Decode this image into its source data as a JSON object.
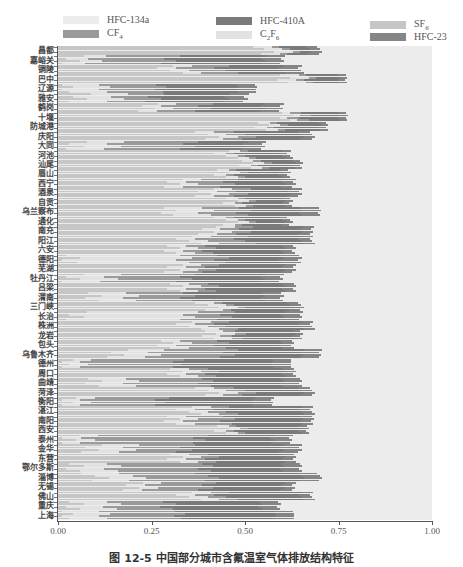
{
  "chart_data": {
    "type": "bar",
    "orientation": "horizontal",
    "stacked": "percent",
    "title": "",
    "caption": "图 12-5   中国部分城市含氟温室气体排放结构特征",
    "xlabel": "",
    "ylabel": "",
    "xlim": [
      0,
      1
    ],
    "xticks": [
      "0.00",
      "0.25",
      "0.50",
      "0.75",
      "1.00"
    ],
    "grid": false,
    "legend_position": "top",
    "legend": [
      {
        "name": "HFC-134a",
        "color": "#ececec"
      },
      {
        "name": "CF4",
        "color": "#9a9a9a"
      },
      {
        "name": "HFC-410A",
        "color": "#7a7a7a"
      },
      {
        "name": "C2F6",
        "color": "#e2e2e2"
      },
      {
        "name": "SF6",
        "color": "#c6c6c6"
      },
      {
        "name": "HFC-23",
        "color": "#858585"
      }
    ],
    "series_order": [
      "SF6",
      "C2F6",
      "CF4",
      "HFC-410A",
      "HFC-23",
      "HFC-134a"
    ],
    "categories": [
      "昌都",
      "嘉峪关",
      "铜陵",
      "巴中",
      "辽源",
      "雅安",
      "鹤岗",
      "十堰",
      "防城港",
      "庆阳",
      "大同",
      "河池",
      "汕尾",
      "眉山",
      "西宁",
      "酒泉",
      "自贡",
      "乌兰察布",
      "通化",
      "南充",
      "阳江",
      "六安",
      "德阳",
      "芜湖",
      "牡丹江",
      "吕梁",
      "渭南",
      "三门峡",
      "长治",
      "株洲",
      "龙岩",
      "包头",
      "乌鲁木齐",
      "德州",
      "周口",
      "曲靖",
      "菏泽",
      "衡阳",
      "湛江",
      "南阳",
      "西安",
      "泰州",
      "金华",
      "东营",
      "鄂尔多斯",
      "淄博",
      "无锡",
      "佛山",
      "重庆",
      "上海"
    ],
    "series": [
      {
        "name": "SF6",
        "values": [
          0.55,
          0.04,
          0.3,
          0.6,
          0.03,
          0.05,
          0.25,
          0.6,
          0.55,
          0.4,
          0.05,
          0.45,
          0.5,
          0.45,
          0.3,
          0.4,
          0.45,
          0.3,
          0.45,
          0.4,
          0.35,
          0.3,
          0.05,
          0.3,
          0.05,
          0.3,
          0.1,
          0.4,
          0.05,
          0.35,
          0.4,
          0.3,
          0.15,
          0.02,
          0.3,
          0.1,
          0.4,
          0.02,
          0.35,
          0.3,
          0.45,
          0.02,
          0.1,
          0.3,
          0.05,
          0.1,
          0.2,
          0.35,
          0.04,
          0.03
        ]
      },
      {
        "name": "C2F6",
        "values": [
          0.05,
          0.06,
          0.05,
          0.05,
          0.1,
          0.1,
          0.05,
          0.02,
          0.03,
          0.05,
          0.1,
          0.03,
          0.03,
          0.03,
          0.05,
          0.05,
          0.03,
          0.1,
          0.03,
          0.05,
          0.05,
          0.05,
          0.3,
          0.05,
          0.1,
          0.05,
          0.1,
          0.05,
          0.3,
          0.05,
          0.05,
          0.05,
          0.1,
          0.05,
          0.05,
          0.1,
          0.05,
          0.05,
          0.05,
          0.05,
          0.03,
          0.05,
          0.1,
          0.05,
          0.1,
          0.1,
          0.05,
          0.05,
          0.1,
          0.1
        ]
      },
      {
        "name": "CF4",
        "values": [
          0.02,
          0.2,
          0.1,
          0.02,
          0.15,
          0.1,
          0.1,
          0.03,
          0.02,
          0.05,
          0.2,
          0.02,
          0.02,
          0.02,
          0.1,
          0.05,
          0.02,
          0.1,
          0.02,
          0.05,
          0.1,
          0.05,
          0.1,
          0.05,
          0.2,
          0.05,
          0.15,
          0.02,
          0.1,
          0.05,
          0.03,
          0.1,
          0.2,
          0.25,
          0.05,
          0.2,
          0.05,
          0.2,
          0.05,
          0.1,
          0.02,
          0.3,
          0.15,
          0.05,
          0.25,
          0.2,
          0.15,
          0.05,
          0.15,
          0.2
        ]
      },
      {
        "name": "HFC-410A",
        "values": [
          0.05,
          0.25,
          0.15,
          0.08,
          0.2,
          0.2,
          0.15,
          0.1,
          0.1,
          0.15,
          0.15,
          0.1,
          0.08,
          0.1,
          0.15,
          0.12,
          0.1,
          0.15,
          0.1,
          0.15,
          0.15,
          0.2,
          0.15,
          0.2,
          0.2,
          0.2,
          0.2,
          0.15,
          0.15,
          0.2,
          0.15,
          0.15,
          0.2,
          0.25,
          0.2,
          0.2,
          0.15,
          0.25,
          0.2,
          0.2,
          0.15,
          0.2,
          0.25,
          0.2,
          0.2,
          0.25,
          0.2,
          0.2,
          0.25,
          0.25
        ]
      },
      {
        "name": "HFC-23",
        "values": [
          0.03,
          0.05,
          0.05,
          0.02,
          0.05,
          0.05,
          0.05,
          0.02,
          0.02,
          0.03,
          0.05,
          0.02,
          0.02,
          0.02,
          0.03,
          0.03,
          0.02,
          0.05,
          0.02,
          0.03,
          0.03,
          0.03,
          0.05,
          0.03,
          0.05,
          0.03,
          0.05,
          0.03,
          0.05,
          0.03,
          0.02,
          0.03,
          0.05,
          0.05,
          0.03,
          0.05,
          0.03,
          0.05,
          0.03,
          0.03,
          0.02,
          0.05,
          0.05,
          0.03,
          0.05,
          0.05,
          0.03,
          0.03,
          0.05,
          0.05
        ]
      },
      {
        "name": "HFC-134a",
        "values": [
          0.3,
          0.4,
          0.35,
          0.23,
          0.47,
          0.5,
          0.4,
          0.23,
          0.28,
          0.32,
          0.45,
          0.38,
          0.35,
          0.38,
          0.37,
          0.35,
          0.38,
          0.3,
          0.38,
          0.32,
          0.32,
          0.37,
          0.35,
          0.37,
          0.4,
          0.37,
          0.4,
          0.35,
          0.35,
          0.32,
          0.35,
          0.37,
          0.3,
          0.38,
          0.37,
          0.35,
          0.32,
          0.43,
          0.32,
          0.32,
          0.33,
          0.38,
          0.35,
          0.37,
          0.35,
          0.3,
          0.37,
          0.32,
          0.41,
          0.37
        ]
      }
    ]
  }
}
